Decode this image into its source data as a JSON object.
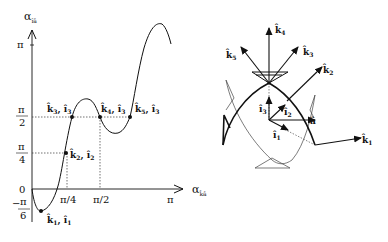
{
  "figure": {
    "left_plot": {
      "y_axis_label": "α",
      "y_axis_subscript": "îâ",
      "x_axis_label": "α",
      "x_axis_subscript": "k̂â",
      "y_ticks": [
        {
          "label": "π",
          "value": "pi"
        },
        {
          "label_num": "π",
          "label_den": "2",
          "value": "pi/2"
        },
        {
          "label_num": "π",
          "label_den": "4",
          "value": "pi/4"
        },
        {
          "label": "0",
          "value": "0"
        },
        {
          "label_num": "π",
          "label_den": "6",
          "sign": "−",
          "value": "-pi/6"
        }
      ],
      "x_ticks": [
        {
          "label": "π/4"
        },
        {
          "label": "π/2"
        },
        {
          "label": "π"
        }
      ],
      "points": [
        {
          "k": "k̂",
          "k_sub": "1",
          "l": "î",
          "l_sub": "1"
        },
        {
          "k": "k̂",
          "k_sub": "2",
          "l": "î",
          "l_sub": "2"
        },
        {
          "k": "k̂",
          "k_sub": "3",
          "l": "î",
          "l_sub": "3"
        },
        {
          "k": "k̂",
          "k_sub": "4",
          "l": "î",
          "l_sub": "3"
        },
        {
          "k": "k̂",
          "k_sub": "5",
          "l": "î",
          "l_sub": "3"
        }
      ]
    },
    "right_diagram": {
      "vectors": [
        {
          "name": "k̂",
          "sub": "1"
        },
        {
          "name": "k̂",
          "sub": "2"
        },
        {
          "name": "k̂",
          "sub": "3"
        },
        {
          "name": "k̂",
          "sub": "4"
        },
        {
          "name": "k̂",
          "sub": "5"
        },
        {
          "name": "î",
          "sub": "1"
        },
        {
          "name": "î",
          "sub": "2"
        },
        {
          "name": "î",
          "sub": "3"
        },
        {
          "name": "â",
          "sub": ""
        }
      ]
    }
  }
}
